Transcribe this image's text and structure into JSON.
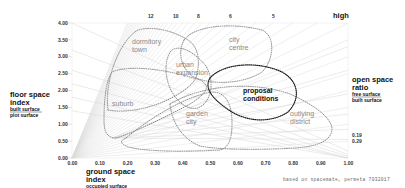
{
  "chart_data": {
    "type": "scatter",
    "title": "",
    "subtitle": "",
    "xlabel": "ground space index",
    "xlabel_sub": [
      "occupied surface",
      "plot surface"
    ],
    "ylabel": "floor space index",
    "ylabel_sub": [
      "built surface",
      "plot surface"
    ],
    "right_label": "open space ratio",
    "right_label_sub": [
      "free surface",
      "built surface"
    ],
    "xlim": [
      0.0,
      1.0
    ],
    "ylim": [
      0.0,
      4.0
    ],
    "x_ticks": [
      "0.00",
      "0.10",
      "0.20",
      "0.30",
      "0.40",
      "0.50",
      "0.60",
      "0.70",
      "0.80",
      "0.90",
      "1.00"
    ],
    "y_ticks": [
      "0.00",
      "0.50",
      "1.00",
      "1.50",
      "2.00",
      "2.50",
      "3.00",
      "3.50",
      "4.00"
    ],
    "top_layer_labels": [
      "12",
      "10",
      "8",
      "6",
      "5"
    ],
    "top_right_label": "high",
    "right_osr_ticks": [
      "0.19",
      "0.29"
    ],
    "grid": true,
    "regions": [
      {
        "name": "dormitory town",
        "style": "dotted-grey",
        "approx_x": [
          0.18,
          0.55
        ],
        "approx_y": [
          1.6,
          4.0
        ]
      },
      {
        "name": "city centre",
        "style": "dotted-grey",
        "approx_x": [
          0.42,
          0.82
        ],
        "approx_y": [
          2.1,
          4.0
        ]
      },
      {
        "name": "urban expansion",
        "style": "dotted-grey",
        "approx_x": [
          0.35,
          0.62
        ],
        "approx_y": [
          1.0,
          3.3
        ]
      },
      {
        "name": "suburb",
        "style": "dotted-grey",
        "approx_x": [
          0.12,
          0.35
        ],
        "approx_y": [
          0.55,
          2.4
        ]
      },
      {
        "name": "garden city",
        "style": "dotted-grey",
        "approx_x": [
          0.2,
          0.6
        ],
        "approx_y": [
          0.0,
          1.6
        ]
      },
      {
        "name": "proposal conditions",
        "style": "dotted-black",
        "approx_x": [
          0.5,
          0.88
        ],
        "approx_y": [
          1.3,
          2.45
        ]
      },
      {
        "name": "outlying district",
        "style": "dotted-grey",
        "approx_x": [
          0.55,
          0.95
        ],
        "approx_y": [
          0.3,
          2.1
        ]
      }
    ],
    "legend": null,
    "annotation": "based on spacemate, permeta 7032017"
  },
  "labels": {
    "floor_space_index": "floor space",
    "floor_space_index_2": "index",
    "fsi_num": "built surface",
    "fsi_den": "plot surface",
    "gsi_1": "ground space",
    "gsi_2": "index",
    "gsi_num": "occupied surface",
    "gsi_den": "plot surface",
    "osr_1": "open space",
    "osr_2": "ratio",
    "osr_num": "free surface",
    "osr_den": "built surface",
    "high": "high",
    "credit": "based on spacemate, permeta 7032017",
    "regions": {
      "dormitory_1": "dormitory",
      "dormitory_2": "town",
      "city_1": "city",
      "city_2": "centre",
      "urban_1": "urban",
      "urban_2": "expansion",
      "suburb": "suburb",
      "garden_1": "garden",
      "garden_2": "city",
      "proposal_1": "proposal",
      "proposal_2": "conditions",
      "outlying_1": "outlying",
      "outlying_2": "district"
    }
  }
}
